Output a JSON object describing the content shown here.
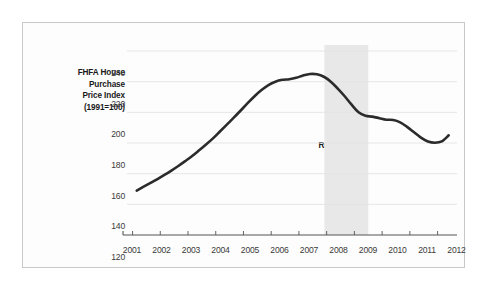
{
  "figure": {
    "background_color": "#fdfdfd",
    "border_color": "#c9c9c9"
  },
  "chart_data": {
    "type": "line",
    "title": "",
    "subtitle": "",
    "xlabel": "",
    "ylabel": "FHFA House Purchase Price Index (1991=100)",
    "ylabel_lines": [
      "FHFA House",
      "Purchase",
      "Price Index",
      "(1991=100)"
    ],
    "xlim": [
      2000.8,
      2012.7
    ],
    "ylim": [
      120,
      240
    ],
    "yticks": [
      120,
      140,
      160,
      180,
      200,
      220,
      240
    ],
    "ytick_labels": [
      "120",
      "140",
      "160",
      "180",
      "200",
      "220",
      "240"
    ],
    "xticks": [
      2001,
      2002,
      2003,
      2004,
      2005,
      2006,
      2007,
      2008,
      2009,
      2010,
      2011,
      2012
    ],
    "xtick_labels": [
      "2001",
      "2002",
      "2003",
      "2004",
      "2005",
      "2006",
      "2007",
      "2008",
      "2009",
      "2010",
      "2011",
      "2012"
    ],
    "grid": true,
    "grid_axis": "y",
    "legend": false,
    "legend_position": "none",
    "line_color": "#2b2b2b",
    "line_width": 2.6,
    "series": [
      {
        "name": "FHFA House Purchase Price Index (1991=100)",
        "x": [
          2001.15,
          2001.4,
          2001.65,
          2001.9,
          2002.15,
          2002.4,
          2002.65,
          2002.9,
          2003.15,
          2003.4,
          2003.65,
          2003.9,
          2004.15,
          2004.4,
          2004.65,
          2004.9,
          2005.15,
          2005.4,
          2005.65,
          2005.9,
          2006.15,
          2006.4,
          2006.65,
          2006.9,
          2007.15,
          2007.4,
          2007.65,
          2007.9,
          2008.15,
          2008.4,
          2008.65,
          2008.9,
          2009.15,
          2009.4,
          2009.65,
          2009.9,
          2010.15,
          2010.4,
          2010.65,
          2010.9,
          2011.15,
          2011.4,
          2011.65,
          2011.9,
          2012.15,
          2012.4
        ],
        "y": [
          149.0,
          151.5,
          154.0,
          156.5,
          159.2,
          162.0,
          165.0,
          168.2,
          171.5,
          175.2,
          179.0,
          183.0,
          187.5,
          192.0,
          196.5,
          201.2,
          206.0,
          210.5,
          214.5,
          217.8,
          220.0,
          221.2,
          221.6,
          222.5,
          224.0,
          225.0,
          224.8,
          223.2,
          220.0,
          215.5,
          210.5,
          205.0,
          200.0,
          197.8,
          197.2,
          196.2,
          195.2,
          195.0,
          193.5,
          190.5,
          187.0,
          183.5,
          181.0,
          180.2,
          181.0,
          185.0
        ]
      }
    ],
    "annotations": [
      {
        "name": "great-recession-band",
        "type": "vspan",
        "label": "Great Recession",
        "label_lines": [
          "Great",
          "Recession"
        ],
        "x_start": 2007.92,
        "x_end": 2009.5,
        "color": "#e8e8e8"
      }
    ]
  }
}
